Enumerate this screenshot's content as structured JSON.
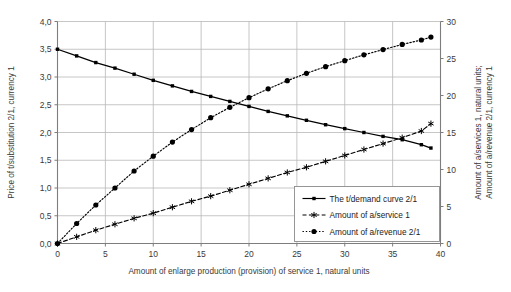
{
  "chart_data": {
    "type": "line",
    "title": "",
    "xlabel": "Amount of enlarge production (provision) of service 1, natural units",
    "ylabel_left": "Price of t/substitution 2/1, currency 1",
    "ylabel_right_line1": "Amount of a/services 1, natural units;",
    "ylabel_right_line2": "Amount of a/revenue 2/1, currency 1",
    "xlim": [
      0,
      40
    ],
    "ylim_left": [
      0,
      4
    ],
    "ylim_right": [
      0,
      30
    ],
    "xticks": [
      "0",
      "5",
      "10",
      "15",
      "20",
      "25",
      "30",
      "35",
      "40"
    ],
    "xtick_values": [
      0,
      5,
      10,
      15,
      20,
      25,
      30,
      35,
      40
    ],
    "yticks_left": [
      "0,0",
      "0,5",
      "1,0",
      "1,5",
      "2,0",
      "2,5",
      "3,0",
      "3,5",
      "4,0"
    ],
    "ytick_values_left": [
      0,
      0.5,
      1.0,
      1.5,
      2.0,
      2.5,
      3.0,
      3.5,
      4.0
    ],
    "yticks_right": [
      "0",
      "5",
      "10",
      "15",
      "20",
      "25",
      "30"
    ],
    "ytick_values_right": [
      0,
      5,
      10,
      15,
      20,
      25,
      30
    ],
    "grid": true,
    "legend_position": "lower-right",
    "series": [
      {
        "name": "The t/demand curve 2/1",
        "axis": "left",
        "line_style": "solid",
        "marker": "square",
        "color": "#000000",
        "x": [
          0,
          2,
          4,
          6,
          8,
          10,
          12,
          14,
          16,
          18,
          20,
          22,
          24,
          26,
          28,
          30,
          32,
          34,
          36,
          38,
          39
        ],
        "y": [
          3.5,
          3.38,
          3.26,
          3.16,
          3.05,
          2.94,
          2.84,
          2.74,
          2.65,
          2.56,
          2.47,
          2.38,
          2.3,
          2.22,
          2.14,
          2.07,
          2.0,
          1.93,
          1.87,
          1.78,
          1.72
        ]
      },
      {
        "name": "Amount of a/service 1",
        "axis": "right",
        "line_style": "dashed",
        "marker": "asterisk",
        "color": "#000000",
        "x": [
          0,
          2,
          4,
          6,
          8,
          10,
          12,
          14,
          16,
          18,
          20,
          22,
          24,
          26,
          28,
          30,
          32,
          34,
          36,
          38,
          39
        ],
        "y": [
          0.0,
          0.9,
          1.8,
          2.6,
          3.4,
          4.1,
          4.9,
          5.7,
          6.4,
          7.2,
          8.0,
          8.8,
          9.6,
          10.3,
          11.1,
          11.9,
          12.7,
          13.5,
          14.3,
          15.2,
          16.2
        ]
      },
      {
        "name": "Amount of a/revenue 2/1",
        "axis": "right",
        "line_style": "dotted",
        "marker": "circle",
        "color": "#000000",
        "x": [
          0,
          2,
          4,
          6,
          8,
          10,
          12,
          14,
          16,
          18,
          20,
          22,
          24,
          26,
          28,
          30,
          32,
          34,
          36,
          38,
          39
        ],
        "y": [
          0.0,
          2.7,
          5.2,
          7.5,
          9.8,
          11.8,
          13.7,
          15.4,
          17.0,
          18.4,
          19.7,
          20.9,
          22.0,
          23.0,
          23.9,
          24.7,
          25.5,
          26.2,
          26.9,
          27.5,
          27.9
        ]
      }
    ]
  },
  "legend": {
    "items": [
      {
        "label": "The t/demand curve 2/1",
        "style": "solid",
        "marker": "square"
      },
      {
        "label": "Amount of a/service 1",
        "style": "dashed",
        "marker": "asterisk"
      },
      {
        "label": "Amount of a/revenue 2/1",
        "style": "dotted",
        "marker": "circle"
      }
    ]
  }
}
